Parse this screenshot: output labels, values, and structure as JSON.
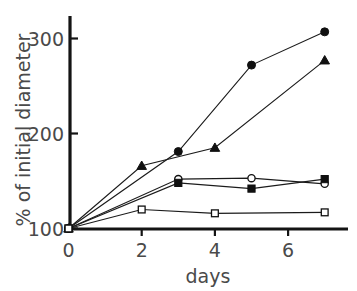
{
  "figure": {
    "background_color": "#ffffff",
    "ink_color": "#1b1b1b",
    "label_color": "#4a4a4a"
  },
  "chart_data": {
    "type": "line",
    "title": "",
    "subtitle": "",
    "xlabel": "days",
    "ylabel": "% of initial diameter",
    "xlim": [
      0,
      7.6
    ],
    "ylim": [
      100,
      320
    ],
    "xticks": [
      0,
      2,
      4,
      6
    ],
    "xtick_labels": [
      "0",
      "2",
      "4",
      "6"
    ],
    "yticks": [
      100,
      200,
      300
    ],
    "ytick_labels": [
      "100",
      "200",
      "300"
    ],
    "grid": false,
    "legend": "none",
    "annotations": [],
    "series": [
      {
        "name": "filled-circle",
        "marker": "filled-circle",
        "x": [
          0,
          3,
          5,
          7
        ],
        "values": [
          100,
          181,
          272,
          307
        ]
      },
      {
        "name": "filled-triangle",
        "marker": "filled-triangle",
        "x": [
          0,
          2,
          4,
          7
        ],
        "values": [
          100,
          166,
          185,
          277
        ]
      },
      {
        "name": "open-circle",
        "marker": "open-circle",
        "x": [
          0,
          3,
          5,
          7
        ],
        "values": [
          100,
          152,
          153,
          147
        ]
      },
      {
        "name": "filled-square",
        "marker": "filled-square",
        "x": [
          0,
          3,
          5,
          7
        ],
        "values": [
          100,
          148,
          142,
          152
        ]
      },
      {
        "name": "open-square",
        "marker": "open-square",
        "x": [
          0,
          2,
          4,
          7
        ],
        "values": [
          100,
          120,
          116,
          117
        ]
      }
    ]
  }
}
